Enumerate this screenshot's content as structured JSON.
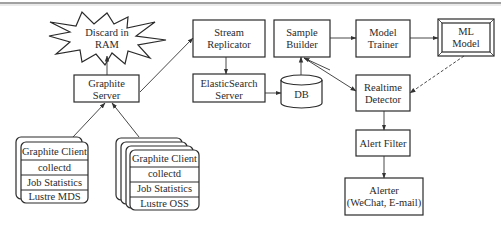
{
  "diagram": {
    "type": "architecture-flow",
    "colors": {
      "stroke": "#2a2a2a",
      "background": "#ffffff",
      "text": "#2a2a2a"
    },
    "nodes": {
      "discard": {
        "shape": "burst",
        "lines": [
          "Discard in",
          "RAM"
        ]
      },
      "graphite_server": {
        "shape": "box",
        "lines": [
          "Graphite",
          "Server"
        ]
      },
      "stream_replicator": {
        "shape": "box",
        "lines": [
          "Stream",
          "Replicator"
        ]
      },
      "elasticsearch_server": {
        "shape": "box",
        "lines": [
          "ElasticSearch",
          "Server"
        ]
      },
      "db": {
        "shape": "cylinder",
        "lines": [
          "DB"
        ]
      },
      "sample_builder": {
        "shape": "box",
        "lines": [
          "Sample",
          "Builder"
        ]
      },
      "model_trainer": {
        "shape": "box",
        "lines": [
          "Model",
          "Trainer"
        ]
      },
      "ml_model": {
        "shape": "double-box",
        "lines": [
          "ML",
          "Model"
        ]
      },
      "realtime_detector": {
        "shape": "box",
        "lines": [
          "Realtime",
          "Detector"
        ]
      },
      "alert_filter": {
        "shape": "box",
        "lines": [
          "Alert Filter"
        ]
      },
      "alerter": {
        "shape": "box",
        "lines": [
          "Alerter",
          "(WeChat, E-mail)"
        ]
      },
      "mds_stack": {
        "shape": "stacked-rounded-box",
        "layers": 2,
        "rows": [
          "Graphite Client",
          "collectd",
          "Job Statistics",
          "Lustre MDS"
        ]
      },
      "oss_stack": {
        "shape": "stacked-rounded-box",
        "layers": 4,
        "rows": [
          "Graphite Client",
          "collectd",
          "Job Statistics",
          "Lustre OSS"
        ]
      }
    },
    "edges": [
      {
        "from": "mds_stack",
        "to": "graphite_server",
        "style": "solid"
      },
      {
        "from": "oss_stack",
        "to": "graphite_server",
        "style": "solid"
      },
      {
        "from": "graphite_server",
        "to": "discard",
        "style": "solid"
      },
      {
        "from": "graphite_server",
        "to": "stream_replicator",
        "style": "solid"
      },
      {
        "from": "stream_replicator",
        "to": "elasticsearch_server",
        "style": "solid"
      },
      {
        "from": "elasticsearch_server",
        "to": "db",
        "style": "solid"
      },
      {
        "from": "db",
        "to": "sample_builder",
        "style": "solid"
      },
      {
        "from": "sample_builder",
        "to": "model_trainer",
        "style": "solid"
      },
      {
        "from": "model_trainer",
        "to": "ml_model",
        "style": "solid"
      },
      {
        "from": "sample_builder",
        "to": "realtime_detector",
        "style": "solid"
      },
      {
        "from": "ml_model",
        "to": "realtime_detector",
        "style": "dashed"
      },
      {
        "from": "realtime_detector",
        "to": "alert_filter",
        "style": "solid"
      },
      {
        "from": "alert_filter",
        "to": "alerter",
        "style": "solid"
      }
    ]
  }
}
